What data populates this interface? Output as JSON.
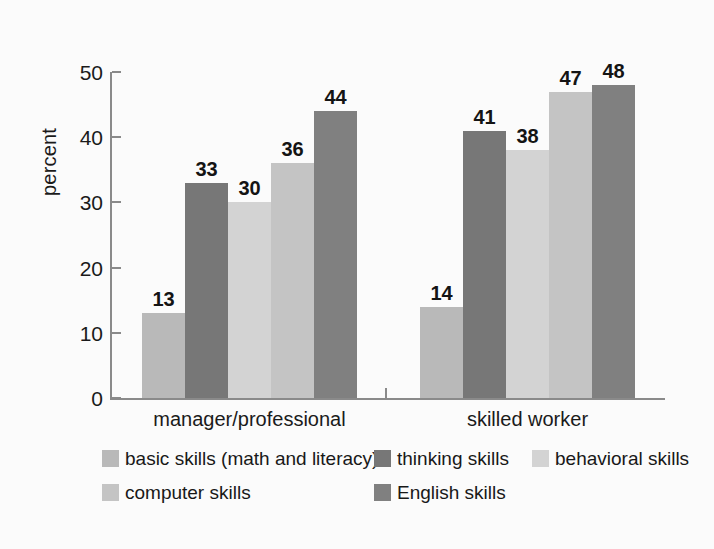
{
  "chart_data": {
    "type": "bar",
    "title": "",
    "subtitle": "",
    "xlabel": "",
    "ylabel": "percent",
    "ylim": [
      0,
      50
    ],
    "yticks": [
      0,
      10,
      20,
      30,
      40,
      50
    ],
    "grid": false,
    "legend_position": "bottom",
    "categories": [
      "manager/professional",
      "skilled worker"
    ],
    "series": [
      {
        "name": "basic skills (math and literacy)",
        "color": "#b9b9b9",
        "values": [
          13,
          14
        ]
      },
      {
        "name": "thinking skills",
        "color": "#777777",
        "values": [
          33,
          41
        ]
      },
      {
        "name": "behavioral skills",
        "color": "#d3d3d3",
        "values": [
          30,
          38
        ]
      },
      {
        "name": "computer skills",
        "color": "#c4c4c4",
        "values": [
          36,
          47
        ]
      },
      {
        "name": "English skills",
        "color": "#808080",
        "values": [
          44,
          48
        ]
      }
    ],
    "data_labels": {
      "manager/professional": [
        "13",
        "33",
        "30",
        "36",
        "44"
      ],
      "skilled worker": [
        "14",
        "41",
        "38",
        "47",
        "48"
      ]
    }
  },
  "axis": {
    "y_title": "percent",
    "y_tick_labels": [
      "0",
      "10",
      "20",
      "30",
      "40",
      "50"
    ],
    "x_tick_labels": [
      "manager/professional",
      "skilled worker"
    ]
  },
  "legend": {
    "rows": [
      [
        {
          "label": "basic skills (math and literacy)",
          "color": "#b9b9b9",
          "left": 0
        },
        {
          "label": "thinking skills",
          "color": "#777777",
          "left": 272
        },
        {
          "label": "behavioral skills",
          "color": "#d3d3d3",
          "left": 430
        }
      ],
      [
        {
          "label": "computer skills",
          "color": "#c4c4c4",
          "left": 0
        },
        {
          "label": "English skills",
          "color": "#808080",
          "left": 272
        }
      ]
    ]
  },
  "colors": {
    "background": "#fbfbfb",
    "axis": "#8a8a8a",
    "text": "#1a1a1a",
    "basic_skills": "#b9b9b9",
    "thinking_skills": "#777777",
    "behavioral_skills": "#d3d3d3",
    "computer_skills": "#c4c4c4",
    "english_skills": "#808080"
  }
}
